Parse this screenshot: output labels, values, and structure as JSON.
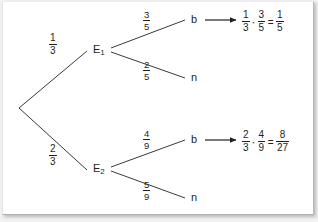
{
  "diagram": {
    "type": "probability-tree-diagram",
    "root": {
      "label": ""
    },
    "branches": [
      {
        "id": "branch-e1",
        "probability": {
          "numerator": "1",
          "denominator": "3"
        },
        "node_label": "E",
        "node_subscript": "1",
        "children": [
          {
            "id": "leaf-e1-b",
            "probability": {
              "numerator": "3",
              "denominator": "5"
            },
            "label": "b",
            "has_arrow": true,
            "result": {
              "terms": [
                {
                  "numerator": "1",
                  "denominator": "3"
                },
                {
                  "numerator": "3",
                  "denominator": "5"
                }
              ],
              "operator": "·",
              "equals": "=",
              "value": {
                "numerator": "1",
                "denominator": "5"
              }
            }
          },
          {
            "id": "leaf-e1-n",
            "probability": {
              "numerator": "2",
              "denominator": "5"
            },
            "label": "n",
            "has_arrow": false
          }
        ]
      },
      {
        "id": "branch-e2",
        "probability": {
          "numerator": "2",
          "denominator": "3"
        },
        "node_label": "E",
        "node_subscript": "2",
        "children": [
          {
            "id": "leaf-e2-b",
            "probability": {
              "numerator": "4",
              "denominator": "9"
            },
            "label": "b",
            "has_arrow": true,
            "result": {
              "terms": [
                {
                  "numerator": "2",
                  "denominator": "3"
                },
                {
                  "numerator": "4",
                  "denominator": "9"
                }
              ],
              "operator": "·",
              "equals": "=",
              "value": {
                "numerator": "8",
                "denominator": "27"
              }
            }
          },
          {
            "id": "leaf-e2-n",
            "probability": {
              "numerator": "5",
              "denominator": "9"
            },
            "label": "n",
            "has_arrow": false
          }
        ]
      }
    ],
    "colors": {
      "ink": "#231f20",
      "page": "#ffffff",
      "backdrop": "#f2f2f2",
      "line": "#3a3a3a"
    }
  }
}
